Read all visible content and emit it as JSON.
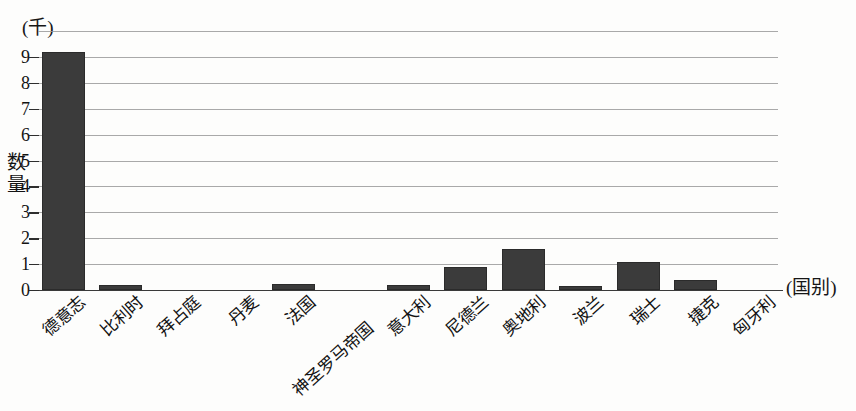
{
  "chart_data": {
    "type": "bar",
    "title": "",
    "xlabel": "(国别)",
    "ylabel": "数量",
    "unit_caption": "(千)",
    "ylim": [
      0,
      10
    ],
    "yticks": [
      0,
      1,
      2,
      3,
      4,
      5,
      6,
      7,
      8,
      9
    ],
    "ytick_labels": [
      "0",
      "1",
      "2",
      "3",
      "4",
      "5",
      "6",
      "7",
      "8",
      "9"
    ],
    "grid": true,
    "legend": "none",
    "categories": [
      "德意志",
      "比利时",
      "拜占庭",
      "丹麦",
      "法国",
      "神圣罗马帝国",
      "意大利",
      "尼德兰",
      "奥地利",
      "波兰",
      "瑞士",
      "捷克",
      "匈牙利"
    ],
    "values": [
      9.2,
      0.2,
      0.0,
      0.0,
      0.25,
      0.0,
      0.2,
      0.9,
      1.6,
      0.15,
      1.1,
      0.4,
      0.0
    ],
    "bar_color": "#3b3b3b"
  },
  "labels": {
    "unit": "(千)",
    "y_axis_title_chars": [
      "数",
      "量"
    ],
    "x_axis_caption": "(国别)"
  }
}
